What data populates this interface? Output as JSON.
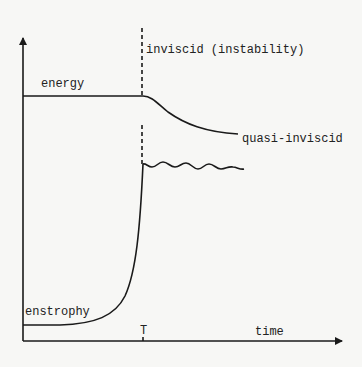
{
  "diagram": {
    "labels": {
      "inviscid": "inviscid (instability)",
      "energy": "energy",
      "quasi_inviscid": "quasi-inviscid",
      "enstrophy": "enstrophy",
      "T": "T",
      "time": "time"
    },
    "colors": {
      "background": "#f7f7f5",
      "ink": "#1a1a1a"
    },
    "axes": {
      "x_label": "time",
      "tick_label": "T"
    },
    "curves": [
      {
        "name": "energy",
        "description": "flat until T, then decays to quasi-inviscid level"
      },
      {
        "name": "enstrophy",
        "description": "low until near T, rises sharply, then oscillates about a plateau"
      }
    ]
  }
}
